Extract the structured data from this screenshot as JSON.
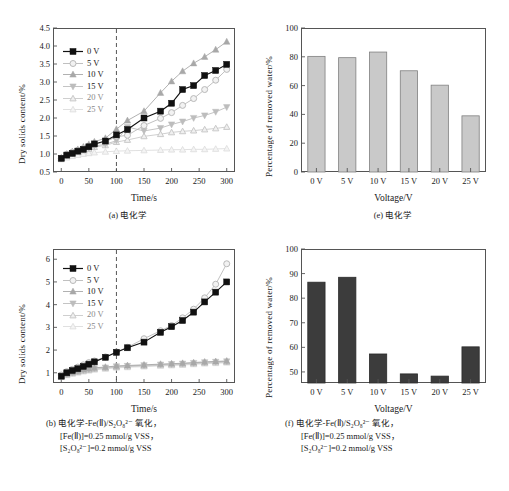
{
  "figure": {
    "background": "#ffffff",
    "series_colors": {
      "0V": "#111111",
      "5V": "#b9b9b9",
      "10V": "#a8a8a8",
      "15V": "#bdbdbd",
      "20V": "#c9c9c9",
      "25V": "#dcdcdc"
    },
    "bar_color_light": "#c9c9c9",
    "bar_color_dark": "#3c3c3c",
    "axis_color": "#555555"
  },
  "panel_a": {
    "caption": "(a) 电化学",
    "chart_data": {
      "type": "line",
      "title": "",
      "xlabel": "Time/s",
      "ylabel": "Dry solids content/%",
      "xlim": [
        -15,
        315
      ],
      "ylim": [
        0.5,
        4.5
      ],
      "xticks": [
        0,
        50,
        100,
        150,
        200,
        250,
        300
      ],
      "yticks": [
        0.5,
        1.0,
        1.5,
        2.0,
        2.5,
        3.0,
        3.5,
        4.0,
        4.5
      ],
      "grid": false,
      "legend_position": "upper-left",
      "annotation_vline_x": 100,
      "x": [
        0,
        10,
        20,
        30,
        40,
        50,
        60,
        80,
        100,
        120,
        150,
        180,
        200,
        220,
        240,
        260,
        280,
        300
      ],
      "series": [
        {
          "name": "0 V",
          "marker": "filled-square",
          "values": [
            0.88,
            0.97,
            1.02,
            1.08,
            1.13,
            1.2,
            1.28,
            1.36,
            1.53,
            1.68,
            2.0,
            2.19,
            2.41,
            2.79,
            2.9,
            3.18,
            3.32,
            3.49
          ]
        },
        {
          "name": "5 V",
          "marker": "open-circle",
          "values": [
            0.88,
            0.99,
            1.05,
            1.1,
            1.15,
            1.2,
            1.27,
            1.34,
            1.48,
            1.52,
            1.79,
            1.99,
            2.15,
            2.35,
            2.54,
            2.79,
            3.05,
            3.35
          ]
        },
        {
          "name": "10 V",
          "marker": "filled-triangle",
          "values": [
            0.9,
            1.0,
            1.07,
            1.13,
            1.2,
            1.27,
            1.34,
            1.44,
            1.69,
            1.93,
            2.19,
            2.7,
            3.02,
            3.3,
            3.52,
            3.7,
            3.9,
            4.12
          ]
        },
        {
          "name": "15 V",
          "marker": "down-triangle",
          "values": [
            0.88,
            0.96,
            1.02,
            1.07,
            1.12,
            1.17,
            1.22,
            1.27,
            1.37,
            1.75,
            1.64,
            1.72,
            1.82,
            1.9,
            2.0,
            2.07,
            2.17,
            2.3
          ]
        },
        {
          "name": "20 V",
          "marker": "open-triangle",
          "values": [
            0.88,
            0.95,
            1.0,
            1.05,
            1.1,
            1.14,
            1.19,
            1.24,
            1.33,
            1.39,
            1.49,
            1.55,
            1.6,
            1.63,
            1.65,
            1.68,
            1.71,
            1.75
          ]
        },
        {
          "name": "25 V",
          "marker": "faint-star",
          "values": [
            0.85,
            0.9,
            0.94,
            0.97,
            1.0,
            1.02,
            1.04,
            1.06,
            1.08,
            1.09,
            1.1,
            1.11,
            1.12,
            1.12,
            1.13,
            1.13,
            1.14,
            1.15
          ]
        }
      ]
    }
  },
  "panel_b": {
    "caption_lines": [
      "(b) 电化学-Fe(Ⅱ)/S₂O₈²⁻ 氧化，",
      "[Fe(Ⅱ)]=0.25 mmol/g VSS，",
      "[S₂O₈²⁻]=0.2 mmol/g VSS"
    ],
    "chart_data": {
      "type": "line",
      "title": "",
      "xlabel": "Time/s",
      "ylabel": "Dry solids content/%",
      "xlim": [
        -15,
        315
      ],
      "ylim": [
        0.55,
        6.45
      ],
      "xticks": [
        0,
        50,
        100,
        150,
        200,
        250,
        300
      ],
      "yticks": [
        1,
        2,
        3,
        4,
        5,
        6
      ],
      "grid": false,
      "legend_position": "upper-left",
      "annotation_vline_x": 100,
      "x": [
        0,
        10,
        20,
        30,
        40,
        50,
        60,
        80,
        100,
        120,
        150,
        180,
        200,
        220,
        240,
        260,
        280,
        300
      ],
      "series": [
        {
          "name": "0 V",
          "marker": "filled-square",
          "values": [
            0.85,
            1.0,
            1.1,
            1.18,
            1.28,
            1.38,
            1.48,
            1.68,
            1.9,
            2.1,
            2.35,
            2.78,
            3.03,
            3.3,
            3.67,
            4.12,
            4.55,
            5.0
          ]
        },
        {
          "name": "5 V",
          "marker": "open-circle",
          "values": [
            0.9,
            1.05,
            1.15,
            1.25,
            1.35,
            1.45,
            1.52,
            1.7,
            1.92,
            2.12,
            2.5,
            2.85,
            3.08,
            3.42,
            3.8,
            4.3,
            4.9,
            5.8
          ]
        },
        {
          "name": "10 V",
          "marker": "filled-triangle",
          "values": [
            0.88,
            0.95,
            1.02,
            1.08,
            1.14,
            1.18,
            1.22,
            1.25,
            1.3,
            1.32,
            1.35,
            1.38,
            1.4,
            1.42,
            1.45,
            1.48,
            1.5,
            1.52
          ]
        },
        {
          "name": "15 V",
          "marker": "down-triangle",
          "values": [
            0.86,
            0.93,
            1.0,
            1.06,
            1.11,
            1.15,
            1.19,
            1.23,
            1.28,
            1.3,
            1.33,
            1.36,
            1.38,
            1.4,
            1.43,
            1.46,
            1.48,
            1.5
          ]
        },
        {
          "name": "20 V",
          "marker": "open-triangle",
          "values": [
            0.84,
            0.91,
            0.98,
            1.03,
            1.08,
            1.12,
            1.16,
            1.2,
            1.25,
            1.27,
            1.3,
            1.33,
            1.35,
            1.37,
            1.4,
            1.43,
            1.45,
            1.47
          ]
        },
        {
          "name": "25 V",
          "marker": "faint-star",
          "values": [
            0.82,
            0.89,
            0.95,
            1.0,
            1.05,
            1.09,
            1.13,
            1.17,
            1.22,
            1.24,
            1.27,
            1.3,
            1.32,
            1.34,
            1.37,
            1.4,
            1.42,
            1.44
          ]
        }
      ]
    }
  },
  "panel_e": {
    "caption": "(e) 电化学",
    "chart_data": {
      "type": "bar",
      "title": "",
      "xlabel": "Voltage/V",
      "ylabel": "Percentage of removed water/%",
      "categories": [
        "0 V",
        "5 V",
        "10 V",
        "15 V",
        "20 V",
        "25 V"
      ],
      "values": [
        80.3,
        79.4,
        83.3,
        70.3,
        60.3,
        39.0
      ],
      "ylim": [
        0,
        100
      ],
      "yticks": [
        0,
        20,
        40,
        60,
        80,
        100
      ],
      "grid": false,
      "bar_fill": "#c9c9c9"
    }
  },
  "panel_f": {
    "caption_lines": [
      "(f) 电化学-Fe(Ⅱ)/S₂O₈²⁻ 氧化，",
      "[Fe(Ⅱ)]=0.25 mmol/g VSS，",
      "[S₂O₈²⁻]=0.2 mmol/g VSS"
    ],
    "chart_data": {
      "type": "bar",
      "title": "",
      "xlabel": "Voltage/V",
      "ylabel": "Percentage of removed water/%",
      "categories": [
        "0 V",
        "5 V",
        "10 V",
        "15 V",
        "20 V",
        "25 V"
      ],
      "values": [
        86.5,
        88.5,
        57.3,
        49.2,
        48.3,
        60.2
      ],
      "ylim": [
        45.5,
        100
      ],
      "yticks": [
        50,
        60,
        70,
        80,
        90,
        100
      ],
      "grid": false,
      "bar_fill": "#3c3c3c"
    }
  },
  "legend_labels": [
    "0 V",
    "5 V",
    "10 V",
    "15 V",
    "20 V",
    "25 V"
  ]
}
